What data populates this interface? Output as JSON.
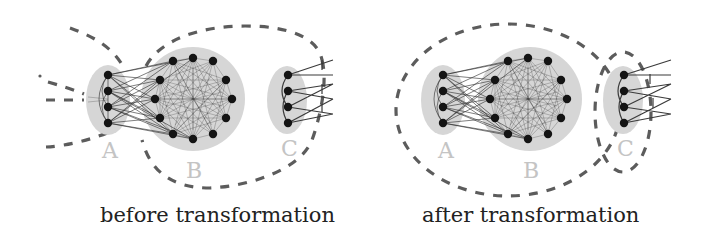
{
  "figure": {
    "panels": [
      {
        "id": "before",
        "caption": "before transformation",
        "clusters": [
          {
            "label": "A",
            "nodes": 4
          },
          {
            "label": "B",
            "nodes": 12
          },
          {
            "label": "C",
            "nodes": 4
          }
        ],
        "partition": "dashed boundaries separate A from B and C (B and C grouped together)"
      },
      {
        "id": "after",
        "caption": "after transformation",
        "clusters": [
          {
            "label": "A",
            "nodes": 4
          },
          {
            "label": "B",
            "nodes": 12
          },
          {
            "label": "C",
            "nodes": 4
          }
        ],
        "partition": "dashed boundaries group A with B; C enclosed separately"
      }
    ],
    "colors": {
      "blob": "#d6d6d6",
      "node": "#141414",
      "dashed_boundary": "#5c5c5c",
      "cluster_label": "#c4c4c4",
      "caption": "#222222"
    }
  }
}
